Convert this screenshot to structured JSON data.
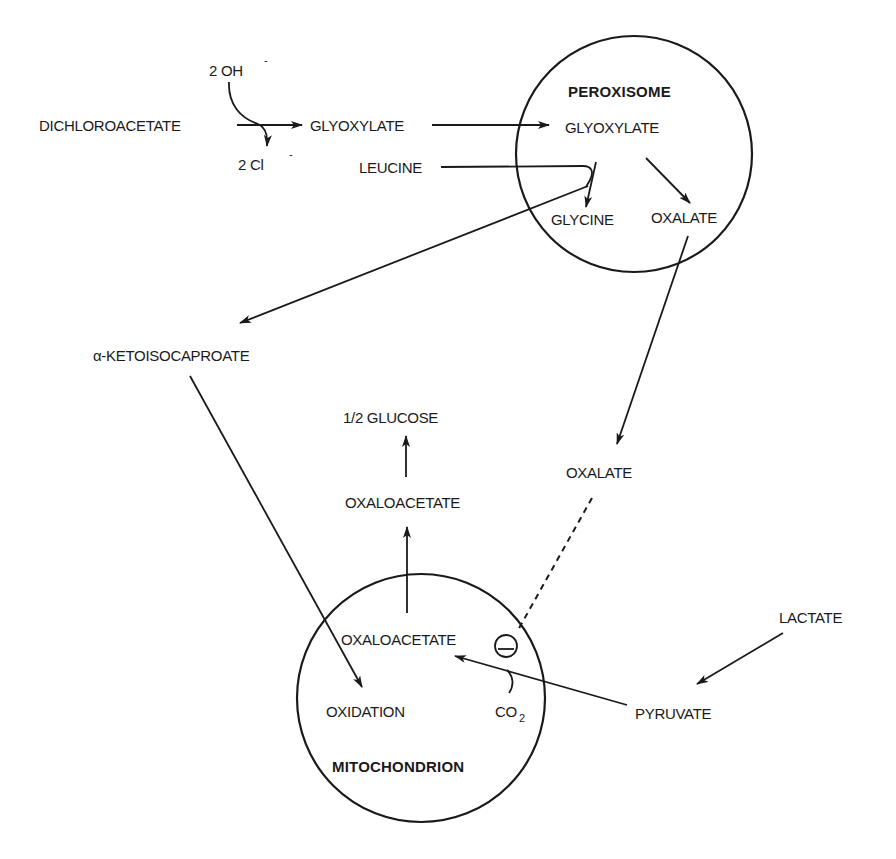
{
  "diagram": {
    "organelles": {
      "peroxisome": {
        "label": "PEROXISOME"
      },
      "mitochondrion": {
        "label": "MITOCHONDRION"
      }
    },
    "nodes": {
      "dichloroacetate": "DICHLOROACETATE",
      "hydroxide": "2 OH",
      "hydroxide_charge": "-",
      "chloride": "2 Cl",
      "chloride_charge": "-",
      "glyoxylate_cytosol": "GLYOXYLATE",
      "leucine": "LEUCINE",
      "glyoxylate_peroxisome": "GLYOXYLATE",
      "glycine": "GLYCINE",
      "oxalate_peroxisome": "OXALATE",
      "ketoisocaproate": "α-KETOISOCAPROATE",
      "half_glucose": "1/2 GLUCOSE",
      "oxaloacetate_cytosol": "OXALOACETATE",
      "oxalate_cytosol": "OXALATE",
      "oxaloacetate_mito": "OXALOACETATE",
      "oxidation": "OXIDATION",
      "co2_main": "CO",
      "co2_sub": "2",
      "lactate": "LACTATE",
      "pyruvate": "PYRUVATE",
      "inhibition_symbol": "−"
    },
    "edges": [
      {
        "from": "DICHLOROACETATE",
        "to": "GLYOXYLATE",
        "note": "2 OH- in, 2 Cl- out"
      },
      {
        "from": "GLYOXYLATE (cytosol)",
        "to": "GLYOXYLATE (peroxisome)"
      },
      {
        "from": "GLYOXYLATE (peroxisome)",
        "to": "GLYCINE",
        "cosubstrate": "LEUCINE"
      },
      {
        "from": "LEUCINE",
        "to": "α-KETOISOCAPROATE"
      },
      {
        "from": "GLYOXYLATE (peroxisome)",
        "to": "OXALATE (peroxisome)"
      },
      {
        "from": "OXALATE (peroxisome)",
        "to": "OXALATE (cytosol)"
      },
      {
        "from": "α-KETOISOCAPROATE",
        "to": "OXIDATION"
      },
      {
        "from": "OXALOACETATE (mitochondrion)",
        "to": "OXALOACETATE (cytosol)"
      },
      {
        "from": "OXALOACETATE (cytosol)",
        "to": "1/2 GLUCOSE"
      },
      {
        "from": "LACTATE",
        "to": "PYRUVATE"
      },
      {
        "from": "PYRUVATE",
        "to": "OXALOACETATE (mitochondrion)",
        "cosubstrate": "CO2"
      },
      {
        "from": "OXALATE (cytosol)",
        "to": "pyruvate carboxylation",
        "type": "inhibition (dashed)"
      }
    ]
  }
}
